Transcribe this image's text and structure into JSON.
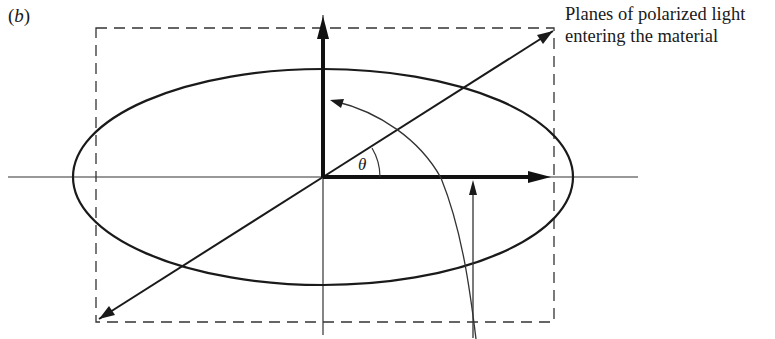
{
  "figure": {
    "panel_label_open": "(",
    "panel_label_letter": "b",
    "panel_label_close": ")",
    "caption_line1": "Planes of polarized light",
    "caption_line2": "entering the material",
    "angle_symbol": "θ"
  },
  "colors": {
    "ink": "#1a1a1a",
    "background": "#ffffff"
  }
}
